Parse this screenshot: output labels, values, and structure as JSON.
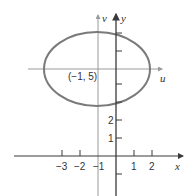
{
  "diagram": {
    "colors": {
      "axis": "#3a3a3a",
      "translated_axis": "#9a9a9a",
      "ellipse": "#7a7a7a",
      "text": "#333333",
      "background": "#ffffff"
    },
    "axes": {
      "x_label": "x",
      "y_label": "y",
      "u_label": "u",
      "v_label": "v"
    },
    "center_label": "(−1, 5)",
    "x_ticks": [
      {
        "value": -3,
        "label": "−3"
      },
      {
        "value": -2,
        "label": "−2"
      },
      {
        "value": -1,
        "label": "−1"
      },
      {
        "value": 1,
        "label": "1"
      },
      {
        "value": 2,
        "label": "2"
      }
    ],
    "y_ticks": [
      {
        "value": 1,
        "label": "1"
      },
      {
        "value": 2,
        "label": "2"
      }
    ],
    "ellipse": {
      "center": [
        -1,
        5
      ],
      "semi_axis_x": 3,
      "semi_axis_y": 2
    }
  }
}
